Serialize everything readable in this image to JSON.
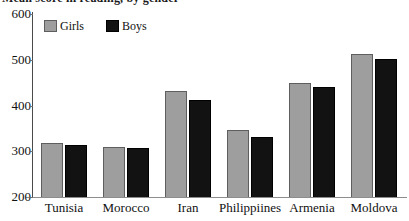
{
  "title_partial": "Mean score in reading, by gender",
  "chart_data": {
    "type": "bar",
    "title": "Mean score in reading, by gender",
    "xlabel": "",
    "ylabel": "",
    "categories": [
      "Tunisia",
      "Morocco",
      "Iran",
      "Philippiines",
      "Armenia",
      "Moldova"
    ],
    "series": [
      {
        "name": "Girls",
        "color": "#9e9e9e",
        "values": [
          318,
          309,
          432,
          346,
          449,
          512
        ]
      },
      {
        "name": "Boys",
        "color": "#121212",
        "values": [
          314,
          307,
          412,
          331,
          441,
          501
        ]
      }
    ],
    "ylim": [
      200,
      600
    ],
    "yticks": [
      200,
      300,
      400,
      500,
      600
    ],
    "ytick_labels": [
      "200",
      "300",
      "400",
      "500",
      "600"
    ],
    "grid": false,
    "legend_position": "top-left-inside"
  },
  "legend": {
    "items": [
      {
        "label": "Girls",
        "swatch": "girls-swatch"
      },
      {
        "label": "Boys",
        "swatch": "boys-swatch"
      }
    ]
  }
}
